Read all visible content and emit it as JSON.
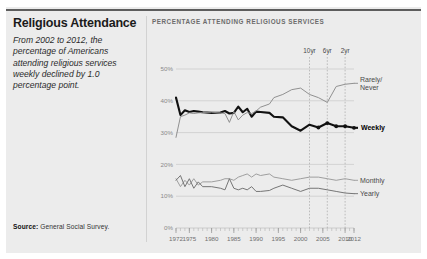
{
  "card": {
    "title": "Religious Attendance",
    "description": "From 2002 to 2012, the percentage of Americans attending religious services weekly declined by 1.0 percentage point.",
    "source_label": "Source:",
    "source_value": "General Social Survey."
  },
  "chart_data": {
    "type": "line",
    "title": "PERCENTAGE ATTENDING RELIGIOUS SERVICES",
    "xlabel": "",
    "ylabel": "",
    "xlim": [
      1972,
      2012
    ],
    "ylim": [
      0,
      50
    ],
    "grid": true,
    "legend_position": "right-inline",
    "ytick_labels": [
      "0%",
      "10%",
      "20%",
      "30%",
      "40%",
      "50%"
    ],
    "ytick_values": [
      0,
      10,
      20,
      30,
      40,
      50
    ],
    "xtick_labels": [
      "1972",
      "1975",
      "1980",
      "1985",
      "1990",
      "1995",
      "2000",
      "2005",
      "2010",
      "2012"
    ],
    "xtick_values": [
      1972,
      1975,
      1980,
      1985,
      1990,
      1995,
      2000,
      2005,
      2010,
      2012
    ],
    "annotations": [
      {
        "label": "10yr",
        "x": 2002
      },
      {
        "label": "6yr",
        "x": 2006
      },
      {
        "label": "2yr",
        "x": 2010
      }
    ],
    "x": [
      1972,
      1973,
      1974,
      1975,
      1976,
      1977,
      1978,
      1980,
      1982,
      1983,
      1984,
      1985,
      1986,
      1987,
      1988,
      1989,
      1990,
      1991,
      1993,
      1994,
      1996,
      1998,
      2000,
      2002,
      2004,
      2006,
      2008,
      2010,
      2012
    ],
    "series": [
      {
        "name": "Weekly",
        "color": "#111111",
        "emphasis": true,
        "label": "Weekly",
        "values": [
          41.0,
          35.5,
          37.0,
          36.5,
          36.8,
          36.6,
          36.4,
          36.2,
          36.3,
          36.8,
          36.0,
          36.2,
          38.2,
          36.4,
          37.5,
          35.0,
          36.6,
          36.5,
          36.2,
          35.0,
          34.8,
          32.0,
          30.6,
          32.5,
          31.6,
          33.0,
          32.0,
          32.0,
          31.5
        ]
      },
      {
        "name": "Rarely/Never",
        "color": "#8b8b8b",
        "emphasis": false,
        "label": "Rarely/\nNever",
        "label_line1": "Rarely/",
        "label_line2": "Never",
        "values": [
          28.5,
          35.0,
          35.5,
          36.2,
          36.0,
          36.2,
          36.3,
          36.4,
          36.2,
          36.0,
          33.2,
          36.6,
          34.0,
          35.5,
          36.3,
          36.0,
          36.8,
          38.0,
          39.0,
          41.0,
          42.0,
          43.5,
          44.0,
          42.0,
          41.0,
          39.5,
          44.5,
          45.2,
          45.5
        ]
      },
      {
        "name": "Monthly",
        "color": "#9a9a9a",
        "emphasis": false,
        "label": "Monthly",
        "values": [
          15.5,
          13.0,
          15.0,
          13.5,
          15.5,
          13.5,
          14.5,
          14.5,
          15.0,
          15.5,
          15.5,
          15.0,
          16.0,
          16.5,
          17.0,
          16.0,
          17.0,
          16.5,
          17.0,
          16.0,
          15.5,
          15.0,
          15.5,
          16.0,
          16.0,
          15.5,
          15.0,
          15.5,
          15.0
        ]
      },
      {
        "name": "Yearly",
        "color": "#6f6f6f",
        "emphasis": false,
        "label": "Yearly",
        "values": [
          15.0,
          16.5,
          13.0,
          15.5,
          12.5,
          14.5,
          13.0,
          13.0,
          12.5,
          12.0,
          15.5,
          12.5,
          12.0,
          12.5,
          12.0,
          13.0,
          11.5,
          11.5,
          11.8,
          12.5,
          13.5,
          12.5,
          11.5,
          12.5,
          12.5,
          12.0,
          11.5,
          11.0,
          10.8
        ]
      }
    ]
  }
}
